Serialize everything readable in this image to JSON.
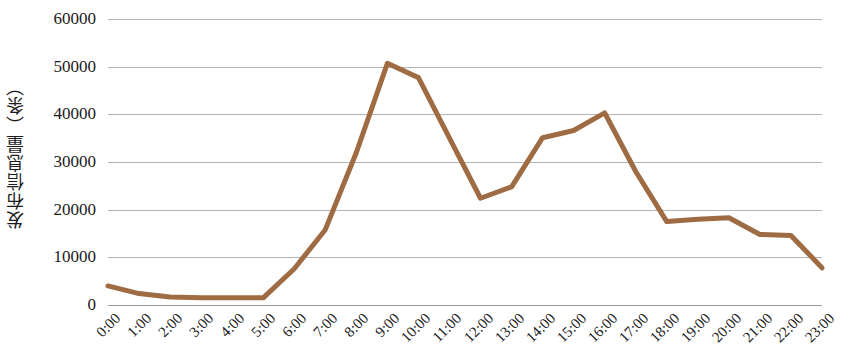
{
  "chart_data": {
    "type": "line",
    "title": "",
    "xlabel": "",
    "ylabel": "发布信息量（条）",
    "ylim": [
      0,
      60000
    ],
    "yticks": [
      0,
      10000,
      20000,
      30000,
      40000,
      50000,
      60000
    ],
    "ytick_labels": [
      "0",
      "10000",
      "20000",
      "30000",
      "40000",
      "50000",
      "60000"
    ],
    "grid": true,
    "legend": "none",
    "line_color": "#9e6b43",
    "line_width": 5,
    "categories": [
      "0:00",
      "1:00",
      "2:00",
      "3:00",
      "4:00",
      "5:00",
      "6:00",
      "7:00",
      "8:00",
      "9:00",
      "10:00",
      "11:00",
      "12:00",
      "13:00",
      "14:00",
      "15:00",
      "16:00",
      "17:00",
      "18:00",
      "19:00",
      "20:00",
      "21:00",
      "22:00",
      "23:00"
    ],
    "values": [
      4000,
      2400,
      1700,
      1500,
      1500,
      1500,
      7600,
      15800,
      32000,
      50700,
      47700,
      35000,
      22400,
      24800,
      35100,
      36600,
      40300,
      28000,
      17500,
      18000,
      18300,
      14800,
      14600,
      7800
    ],
    "series": [
      {
        "name": "发布信息量",
        "color": "#9e6b43",
        "values": [
          4000,
          2400,
          1700,
          1500,
          1500,
          1500,
          7600,
          15800,
          32000,
          50700,
          47700,
          35000,
          22400,
          24800,
          35100,
          36600,
          40300,
          28000,
          17500,
          18000,
          18300,
          14800,
          14600,
          7800
        ]
      }
    ]
  }
}
